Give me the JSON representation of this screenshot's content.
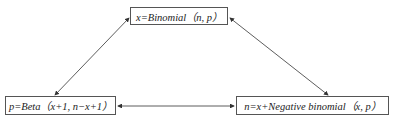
{
  "diagram": {
    "nodes": [
      {
        "id": "binomial",
        "label": "x=Binomial（n, p）"
      },
      {
        "id": "beta",
        "label": "p=Beta（x+1, n−x+1）"
      },
      {
        "id": "negbinomial",
        "label": "n=x+Negative binomial（x, p）"
      }
    ],
    "edges": [
      {
        "from": "binomial",
        "to": "beta",
        "direction": "both"
      },
      {
        "from": "binomial",
        "to": "negbinomial",
        "direction": "both"
      },
      {
        "from": "beta",
        "to": "negbinomial",
        "direction": "both"
      }
    ],
    "colors": {
      "line": "#333333",
      "border": "#555555",
      "text": "#222222"
    }
  }
}
